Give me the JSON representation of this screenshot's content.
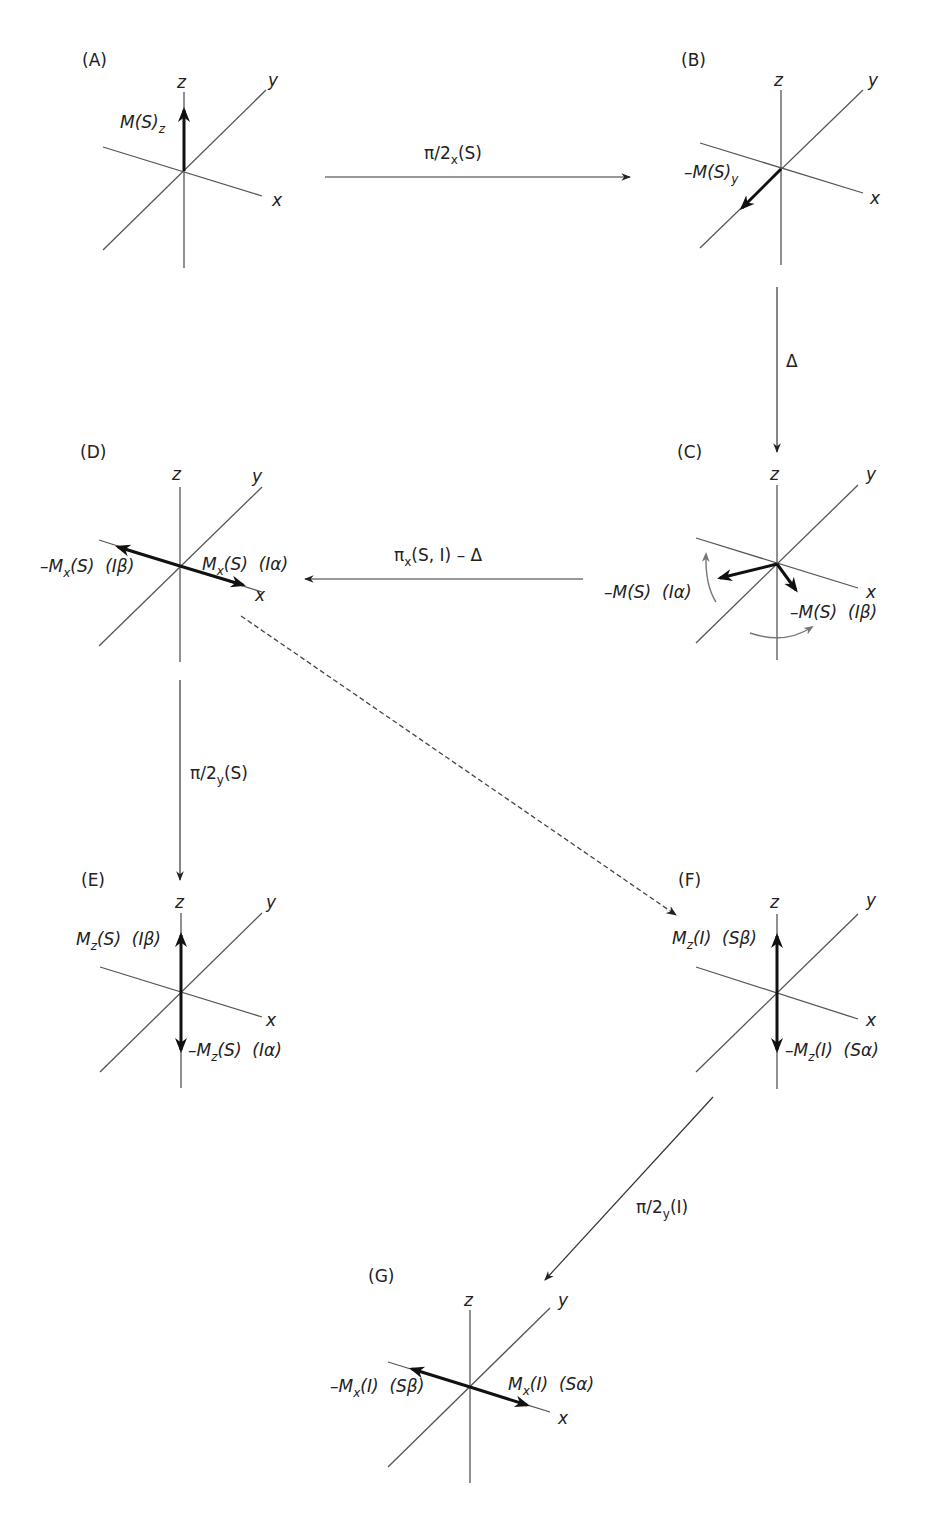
{
  "panels": {
    "A": {
      "label": "(A)",
      "vector": "M(S)_z"
    },
    "B": {
      "label": "(B)",
      "vector": "-M(S)_y"
    },
    "C": {
      "label": "(C)",
      "vector_left": "-M(S) (Iα)",
      "vector_right": "-M(S) (Iβ)"
    },
    "D": {
      "label": "(D)",
      "vector_left": "-M_x(S) (Iβ)",
      "vector_right": "M_x(S) (Iα)"
    },
    "E": {
      "label": "(E)",
      "vector_up": "M_z(S) (Iβ)",
      "vector_down": "-M_z(S) (Iα)"
    },
    "F": {
      "label": "(F)",
      "vector_up": "M_z(I) (Sβ)",
      "vector_down": "-M_z(I) (Sα)"
    },
    "G": {
      "label": "(G)",
      "vector_left": "-M_x(I) (Sβ)",
      "vector_right": "M_x(I) (Sα)"
    }
  },
  "axes": {
    "x": "x",
    "y": "y",
    "z": "z"
  },
  "transitions": [
    {
      "from": "A",
      "to": "B",
      "pulse": "π/2",
      "sub": "x",
      "arg": "(S)"
    },
    {
      "from": "B",
      "to": "C",
      "pulse": "Δ",
      "sub": "",
      "arg": ""
    },
    {
      "from": "C",
      "to": "D",
      "pulse": "π",
      "sub": "x",
      "arg": "(S, I) – Δ"
    },
    {
      "from": "D",
      "to": "E",
      "pulse": "π/2",
      "sub": "y",
      "arg": "(S)"
    },
    {
      "from": "D",
      "to": "F",
      "pulse": "",
      "sub": "",
      "arg": "",
      "style": "dashed"
    },
    {
      "from": "F",
      "to": "G",
      "pulse": "π/2",
      "sub": "y",
      "arg": "(I)"
    }
  ],
  "text": {
    "a_vec_main": "M(S)",
    "a_vec_sub": "z",
    "b_vec_main": "–M(S)",
    "b_vec_sub": "y",
    "c_left_main": "–M(S)",
    "c_left_tag": "(Iα)",
    "c_right_main": "–M(S)",
    "c_right_tag": "(Iβ)",
    "d_left_pre": "–M",
    "d_left_sub": "x",
    "d_left_post": "(S)",
    "d_left_tag": "(Iβ)",
    "d_right_pre": "M",
    "d_right_sub": "x",
    "d_right_post": "(S)",
    "d_right_tag": "(Iα)",
    "e_up_pre": "M",
    "e_up_sub": "z",
    "e_up_post": "(S)",
    "e_up_tag": "(Iβ)",
    "e_dn_pre": "–M",
    "e_dn_sub": "z",
    "e_dn_post": "(S)",
    "e_dn_tag": "(Iα)",
    "f_up_pre": "M",
    "f_up_sub": "z",
    "f_up_post": "(I)",
    "f_up_tag": "(Sβ)",
    "f_dn_pre": "–M",
    "f_dn_sub": "z",
    "f_dn_post": "(I)",
    "f_dn_tag": "(Sα)",
    "g_left_pre": "–M",
    "g_left_sub": "x",
    "g_left_post": "(I)",
    "g_left_tag": "(Sβ)",
    "g_right_pre": "M",
    "g_right_sub": "x",
    "g_right_post": "(I)",
    "g_right_tag": "(Sα)"
  },
  "colors": {
    "ink": "#222222",
    "axis": "#555555",
    "rotation_arrow": "#777777"
  }
}
